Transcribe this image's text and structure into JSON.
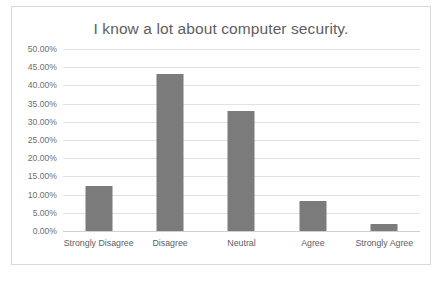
{
  "chart_data": {
    "type": "bar",
    "title": "I know a lot about computer security.",
    "xlabel": "",
    "ylabel": "",
    "categories": [
      "Strongly Disagree",
      "Disagree",
      "Neutral",
      "Agree",
      "Strongly Agree"
    ],
    "values": [
      12.3,
      43.0,
      33.0,
      8.2,
      2.0
    ],
    "value_labels": [
      "12.30%",
      "43.00%",
      "33.00%",
      "8.20%",
      "2.00%"
    ],
    "ylim": [
      0,
      50
    ],
    "ytick_step": 5,
    "ytick_labels": [
      "50.00%",
      "45.00%",
      "40.00%",
      "35.00%",
      "30.00%",
      "25.00%",
      "20.00%",
      "15.00%",
      "10.00%",
      "5.00%",
      "0.00%"
    ],
    "grid": true,
    "legend": false,
    "legend_position": "none",
    "bar_color": "#7b7b7b",
    "title_color": "#5e5e5e",
    "tick_color": "#6e6e6e",
    "gridline_color": "#e2e2e2",
    "border_color": "#d9d9d9",
    "background": "#ffffff"
  }
}
